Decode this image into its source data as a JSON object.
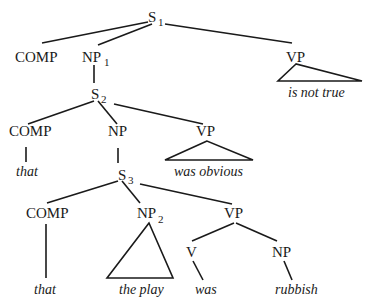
{
  "diagram": {
    "type": "syntax-tree",
    "nodes": {
      "s1": {
        "label": "S",
        "sub": "1"
      },
      "comp1": {
        "label": "COMP"
      },
      "np1": {
        "label": "NP",
        "sub": "1"
      },
      "vp1": {
        "label": "VP",
        "leaf": "is not true"
      },
      "s2": {
        "label": "S",
        "sub": "2"
      },
      "comp2": {
        "label": "COMP",
        "leaf": "that"
      },
      "np": {
        "label": "NP"
      },
      "vp2": {
        "label": "VP",
        "leaf": "was obvious"
      },
      "s3": {
        "label": "S",
        "sub": "3"
      },
      "comp3": {
        "label": "COMP",
        "leaf": "that"
      },
      "np2": {
        "label": "NP",
        "sub": "2",
        "leaf": "the play"
      },
      "vp3": {
        "label": "VP"
      },
      "v": {
        "label": "V",
        "leaf": "was"
      },
      "np3": {
        "label": "NP",
        "leaf": "rubbish"
      }
    }
  }
}
